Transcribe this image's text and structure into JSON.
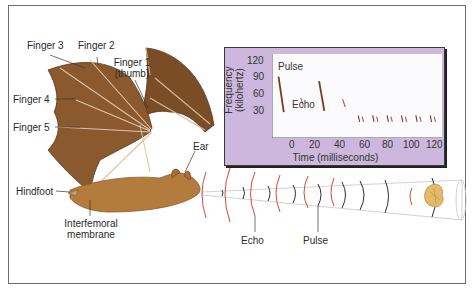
{
  "figure": {
    "labels": {
      "finger3": "Finger 3",
      "finger2": "Finger 2",
      "finger1_line1": "Finger 1",
      "finger1_line2": "(thumb)",
      "finger4": "Finger 4",
      "finger5": "Finger 5",
      "ear": "Ear",
      "hindfoot": "Hindfoot",
      "interfemoral_line1": "Interfemoral",
      "interfemoral_line2": "membrane",
      "echo": "Echo",
      "pulse": "Pulse"
    },
    "colors": {
      "wing": "#8a5a2e",
      "body": "#b37b3c",
      "pulse_arc": "#d4493a",
      "echo_arc": "#2c2c3a",
      "panel": "#cdb7dd",
      "moth": "#e3b96a"
    }
  },
  "chart_data": {
    "type": "scatter",
    "title": "",
    "xlabel": "Time (milliseconds)",
    "ylabel_line1": "Frequency",
    "ylabel_line2": "(kilohertz)",
    "x_ticks": [
      "0",
      "20",
      "40",
      "60",
      "80",
      "100",
      "120"
    ],
    "y_ticks": [
      "120",
      "90",
      "60",
      "30"
    ],
    "xlim": [
      -5,
      125
    ],
    "ylim": [
      0,
      130
    ],
    "annotations": {
      "pulse": "Pulse",
      "echo": "Echo"
    },
    "series": [
      {
        "name": "Pulse",
        "points": [
          {
            "t_start": 0,
            "t_end": 4,
            "f_start": 95,
            "f_end": 40
          },
          {
            "t_start": 31,
            "t_end": 35,
            "f_start": 88,
            "f_end": 42
          },
          {
            "t_start": 61,
            "t_end": 62,
            "f_start": 35,
            "f_end": 25
          },
          {
            "t_start": 72,
            "t_end": 73,
            "f_start": 35,
            "f_end": 25
          },
          {
            "t_start": 83,
            "t_end": 84,
            "f_start": 35,
            "f_end": 25
          },
          {
            "t_start": 94,
            "t_end": 95,
            "f_start": 35,
            "f_end": 25
          },
          {
            "t_start": 105,
            "t_end": 106,
            "f_start": 35,
            "f_end": 25
          },
          {
            "t_start": 116,
            "t_end": 117,
            "f_start": 35,
            "f_end": 25
          }
        ]
      },
      {
        "name": "Echo",
        "points": [
          {
            "t_start": 17,
            "t_end": 19,
            "f_start": 62,
            "f_end": 50
          },
          {
            "t_start": 49,
            "t_end": 51,
            "f_start": 60,
            "f_end": 48
          },
          {
            "t_start": 64,
            "t_end": 65,
            "f_start": 33,
            "f_end": 25
          },
          {
            "t_start": 75,
            "t_end": 76,
            "f_start": 33,
            "f_end": 25
          },
          {
            "t_start": 86,
            "t_end": 87,
            "f_start": 33,
            "f_end": 25
          },
          {
            "t_start": 97,
            "t_end": 98,
            "f_start": 33,
            "f_end": 25
          },
          {
            "t_start": 108,
            "t_end": 109,
            "f_start": 33,
            "f_end": 25
          },
          {
            "t_start": 119,
            "t_end": 120,
            "f_start": 33,
            "f_end": 25
          }
        ]
      }
    ],
    "grid": false
  }
}
